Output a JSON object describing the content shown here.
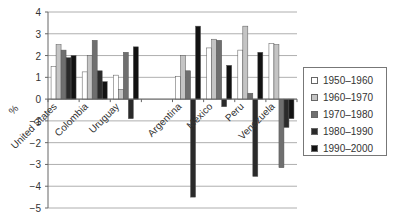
{
  "chart_data": {
    "type": "bar",
    "title": "",
    "xlabel": "",
    "ylabel": "%",
    "ylim": [
      -5,
      4
    ],
    "yticks": [
      4,
      3,
      2,
      1,
      0,
      -1,
      -2,
      -3,
      -4,
      -5
    ],
    "grid": true,
    "legend_position": "right",
    "categories": [
      "United States",
      "Colombia",
      "Uruguay",
      "",
      "Argentina",
      "Mexico",
      "Peru",
      "Venezuela"
    ],
    "series": [
      {
        "name": "1950–1960",
        "color": "#ffffff",
        "values": [
          1.5,
          1.25,
          1.1,
          null,
          1.05,
          2.35,
          2.25,
          2.55
        ]
      },
      {
        "name": "1960–1970",
        "color": "#c4c4c4",
        "values": [
          2.5,
          2.0,
          0.45,
          null,
          2.0,
          2.75,
          3.35,
          2.5
        ]
      },
      {
        "name": "1970–1980",
        "color": "#6f6f6f",
        "values": [
          2.25,
          2.7,
          2.15,
          null,
          1.3,
          2.7,
          0.27,
          -3.15
        ]
      },
      {
        "name": "1980–1990",
        "color": "#2a2a2a",
        "values": [
          1.9,
          1.3,
          -0.9,
          null,
          -4.5,
          -0.35,
          -3.55,
          -1.3
        ]
      },
      {
        "name": "1990–2000",
        "color": "#121212",
        "values": [
          2.0,
          0.8,
          2.4,
          null,
          3.35,
          1.55,
          2.15,
          -0.9
        ]
      }
    ]
  },
  "legend": {
    "items": [
      {
        "label": "1950–1960",
        "color": "#ffffff"
      },
      {
        "label": "1960–1970",
        "color": "#c4c4c4"
      },
      {
        "label": "1970–1980",
        "color": "#6f6f6f"
      },
      {
        "label": "1980–1990",
        "color": "#2a2a2a"
      },
      {
        "label": "1990–2000",
        "color": "#121212"
      }
    ]
  },
  "axis": {
    "y_unit_label": "%"
  }
}
